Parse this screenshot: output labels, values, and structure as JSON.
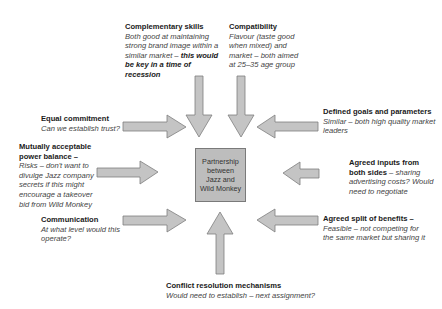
{
  "diagram": {
    "center": {
      "lines": [
        "Partnership",
        "between",
        "Jazz and",
        "Wild Monkey"
      ]
    },
    "colors": {
      "arrow_fill": "#c4c4c4",
      "arrow_stroke": "#7f7f7f",
      "box_fill": "#bdbdbd"
    },
    "factors": {
      "complementary_skills": {
        "title": "Complementary skills",
        "body": "Both good at maintaining strong brand image within a similar market –",
        "emphasis": "this would be key in a time of recession"
      },
      "compatibility": {
        "title": "Compatibility",
        "body": "Flavour (taste good when mixed) and market – both aimed at 25–35 age group"
      },
      "equal_commitment": {
        "title": "Equal commitment",
        "body": "Can we establish trust?"
      },
      "power_balance": {
        "title": "Mutually acceptable power balance –",
        "body": "Risks – don't want to divulge Jazz company secrets if this might encourage a takeover bid from Wild Monkey"
      },
      "communication": {
        "title": "Communication",
        "body": "At what level would this operate?"
      },
      "defined_goals": {
        "title": "Defined goals and parameters",
        "body": "Similar – both high quality market leaders"
      },
      "agreed_inputs": {
        "title": "Agreed inputs from both sides",
        "body": " – sharing advertising costs? Would need to negotiate"
      },
      "agreed_split": {
        "title": "Agreed split of benefits –",
        "body": "Feasible – not competing for the same market but sharing it"
      },
      "conflict_resolution": {
        "title": "Conflict resolution mechanisms",
        "body": "Would need to establish – next assignment?"
      }
    }
  }
}
